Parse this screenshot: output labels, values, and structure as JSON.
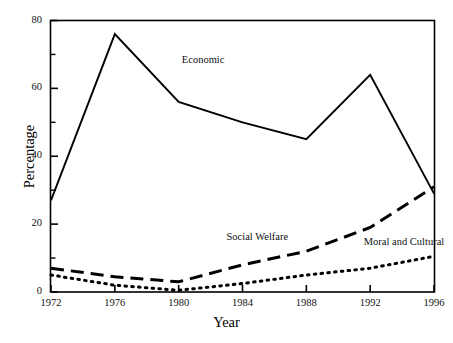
{
  "chart_data": {
    "type": "line",
    "title": "",
    "xlabel": "Year",
    "ylabel": "Percentage",
    "x": [
      1972,
      1976,
      1980,
      1984,
      1988,
      1992,
      1996
    ],
    "xtick_labels": [
      "1972",
      "1976",
      "1980",
      "1984",
      "1988",
      "1992",
      "1996"
    ],
    "ytick_labels": [
      "0",
      "20",
      "40",
      "60",
      "80"
    ],
    "ytick_values": [
      0,
      20,
      40,
      60,
      80
    ],
    "yminor_values": [
      10,
      30,
      50,
      70
    ],
    "xlim": [
      1972,
      1996
    ],
    "ylim": [
      0,
      80
    ],
    "grid": false,
    "legend_position": "inline-annotations",
    "series": [
      {
        "name": "Economic",
        "style": "solid",
        "color": "#000000",
        "values": [
          27,
          76,
          56,
          50,
          45,
          64,
          29
        ],
        "label_x": 1980.2,
        "label_y": 68
      },
      {
        "name": "Social Welfare",
        "style": "dashed",
        "color": "#000000",
        "values": [
          7,
          4.5,
          3,
          8,
          12,
          19,
          31
        ],
        "label_x": 1983.0,
        "label_y": 16
      },
      {
        "name": "Moral and Cultural",
        "style": "dotted",
        "color": "#000000",
        "values": [
          5,
          2,
          0.5,
          2.5,
          5,
          7,
          10.5
        ],
        "label_x": 1991.6,
        "label_y": 14.5
      }
    ],
    "annotations": [
      {
        "name": "economic-label",
        "text": "Economic"
      },
      {
        "name": "social-welfare-label",
        "text": "Social Welfare"
      },
      {
        "name": "moral-cultural-label",
        "text": "Moral and Cultural"
      }
    ],
    "axis_colors": {
      "frame": "#000000",
      "ink": "#000000"
    }
  }
}
